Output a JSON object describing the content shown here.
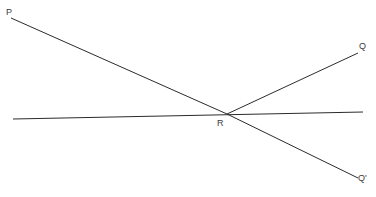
{
  "figure": {
    "title": "",
    "background_color": "#ffffff",
    "stroke_color": "#2b2b2b",
    "label_color": "#3a3a3a",
    "stroke_width": 1,
    "width": 376,
    "height": 197
  },
  "labels": {
    "p": "P",
    "q": "Q",
    "q_prime": "Q'",
    "r": "R"
  },
  "geometry": {
    "intersection_point": {
      "name": "R",
      "x": 227,
      "y": 114
    },
    "segments": [
      {
        "name": "horizontal-line",
        "x1": 13,
        "y1": 119,
        "x2": 363,
        "y2": 112
      },
      {
        "name": "ray-P-to-R",
        "x1": 11,
        "y1": 18,
        "x2": 227,
        "y2": 114
      },
      {
        "name": "ray-R-to-Qprime",
        "x1": 227,
        "y1": 114,
        "x2": 358,
        "y2": 178
      },
      {
        "name": "ray-R-to-Q",
        "x1": 227,
        "y1": 114,
        "x2": 358,
        "y2": 53
      }
    ]
  }
}
